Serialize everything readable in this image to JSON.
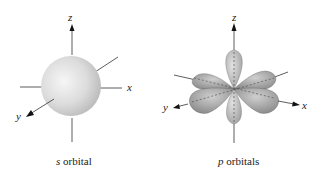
{
  "figures": [
    {
      "id": "s-orbital",
      "caption_symbol": "s",
      "caption_text": " orbital",
      "axes": {
        "z": "z",
        "x": "x",
        "y": "y"
      },
      "colors": {
        "sphere_light": "#f2f2f2",
        "sphere_dark": "#b8b8b8",
        "axis": "#333333"
      }
    },
    {
      "id": "p-orbitals",
      "caption_symbol": "p",
      "caption_text": " orbitals",
      "axes": {
        "z": "z",
        "x": "x",
        "y": "y"
      },
      "colors": {
        "lobe_light": "#d0d0d0",
        "lobe_dark": "#8a8a8a",
        "axis": "#333333"
      }
    }
  ]
}
